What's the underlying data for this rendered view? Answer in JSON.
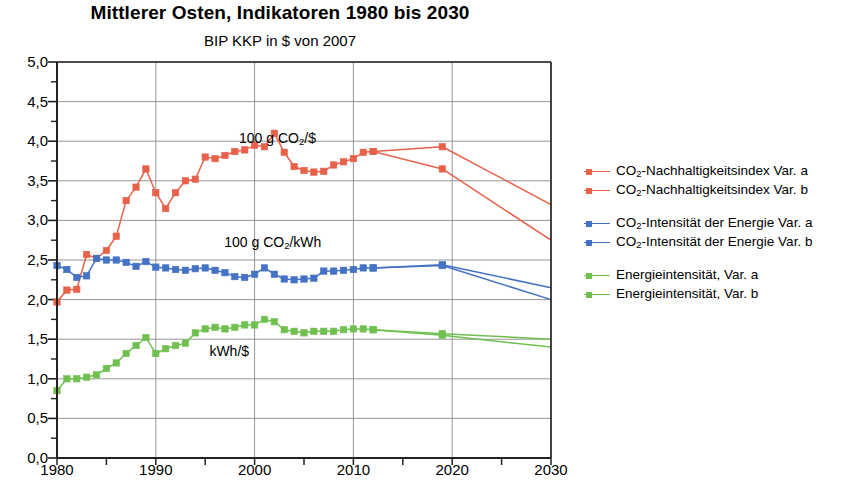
{
  "header": {
    "title": "Mittlerer Osten, Indikatoren 1980 bis 2030",
    "subtitle": "BIP KKP in $ von 2007"
  },
  "legend": {
    "groups": [
      {
        "color": "#e8614a",
        "items": [
          {
            "label_prefix": "CO",
            "label_sub": "2",
            "label_suffix": "-Nachhaltigkeitsindex Var. a",
            "name": "legend-item-co2-nachhaltigkeitsindex-var-a"
          },
          {
            "label_prefix": "CO",
            "label_sub": "2",
            "label_suffix": "-Nachhaltigkeitsindex Var. b",
            "name": "legend-item-co2-nachhaltigkeitsindex-var-b"
          }
        ]
      },
      {
        "color": "#4472c4",
        "items": [
          {
            "label_prefix": "CO",
            "label_sub": "2",
            "label_suffix": "-Intensität der Energie Var. a",
            "name": "legend-item-co2-intensitaet-var-a"
          },
          {
            "label_prefix": "CO",
            "label_sub": "2",
            "label_suffix": "-Intensität der Energie Var. b",
            "name": "legend-item-co2-intensitaet-var-b"
          }
        ]
      },
      {
        "color": "#70c050",
        "items": [
          {
            "label_prefix": "Energieintensität, Var. a",
            "label_sub": "",
            "label_suffix": "",
            "name": "legend-item-energieintensitaet-var-a"
          },
          {
            "label_prefix": "Energieintensität, Var. b",
            "label_sub": "",
            "label_suffix": "",
            "name": "legend-item-energieintensitaet-var-b"
          }
        ]
      }
    ]
  },
  "chart_data": {
    "type": "line",
    "title": "Mittlerer Osten, Indikatoren 1980 bis 2030",
    "subtitle": "BIP KKP in $ von 2007",
    "xlabel": "",
    "ylabel": "",
    "xlim": [
      1980,
      2030
    ],
    "ylim": [
      0.0,
      5.0
    ],
    "ytick_labels": [
      "0,0",
      "0,5",
      "1,0",
      "1,5",
      "2,0",
      "2,5",
      "3,0",
      "3,5",
      "4,0",
      "4,5",
      "5,0"
    ],
    "ytick_values": [
      0.0,
      0.5,
      1.0,
      1.5,
      2.0,
      2.5,
      3.0,
      3.5,
      4.0,
      4.5,
      5.0
    ],
    "yminor_step": 0.25,
    "xtick_labels": [
      "1980",
      "1990",
      "2000",
      "2010",
      "2020",
      "2030"
    ],
    "xtick_values": [
      1980,
      1990,
      2000,
      2010,
      2020,
      2030
    ],
    "xminor_step": 5,
    "grid": "horizontal-major and vertical-decade",
    "legend_position": "right",
    "annotations": [
      {
        "text_prefix": "100 g CO",
        "text_sub": "2",
        "text_suffix": "/$",
        "x": 2004.5,
        "y": 4.02,
        "name": "annotation-co2-per-dollar"
      },
      {
        "text_prefix": "100 g CO",
        "text_sub": "2",
        "text_suffix": "/kWh",
        "x": 2003.0,
        "y": 2.7,
        "name": "annotation-co2-per-kwh"
      },
      {
        "text_prefix": "kWh/$",
        "text_sub": "",
        "text_suffix": "",
        "x": 2001.5,
        "y": 1.32,
        "name": "annotation-kwh-per-dollar"
      }
    ],
    "series": [
      {
        "name": "CO2-Nachhaltigkeitsindex Var. a",
        "color": "#e8614a",
        "markers": true,
        "x": [
          1980,
          1981,
          1982,
          1983,
          1984,
          1985,
          1986,
          1987,
          1988,
          1989,
          1990,
          1991,
          1992,
          1993,
          1994,
          1995,
          1996,
          1997,
          1998,
          1999,
          2000,
          2001,
          2002,
          2003,
          2004,
          2005,
          2006,
          2007,
          2008,
          2009,
          2010,
          2011,
          2012,
          2019,
          2030
        ],
        "values": [
          1.97,
          2.12,
          2.13,
          2.57,
          2.52,
          2.62,
          2.8,
          3.25,
          3.42,
          3.65,
          3.35,
          3.15,
          3.35,
          3.5,
          3.52,
          3.8,
          3.78,
          3.82,
          3.87,
          3.89,
          3.95,
          3.93,
          4.1,
          3.86,
          3.68,
          3.63,
          3.61,
          3.62,
          3.7,
          3.74,
          3.78,
          3.86,
          3.87,
          3.65,
          2.75
        ]
      },
      {
        "name": "CO2-Nachhaltigkeitsindex Var. b",
        "color": "#e8614a",
        "markers": true,
        "x": [
          2012,
          2019,
          2030
        ],
        "values": [
          3.87,
          3.93,
          3.2
        ]
      },
      {
        "name": "CO2-Intensität der Energie Var. a",
        "color": "#4472c4",
        "markers": true,
        "x": [
          1980,
          1981,
          1982,
          1983,
          1984,
          1985,
          1986,
          1987,
          1988,
          1989,
          1990,
          1991,
          1992,
          1993,
          1994,
          1995,
          1996,
          1997,
          1998,
          1999,
          2000,
          2001,
          2002,
          2003,
          2004,
          2005,
          2006,
          2007,
          2008,
          2009,
          2010,
          2011,
          2012,
          2019,
          2030
        ],
        "values": [
          2.43,
          2.38,
          2.28,
          2.3,
          2.52,
          2.5,
          2.5,
          2.47,
          2.42,
          2.48,
          2.41,
          2.4,
          2.38,
          2.37,
          2.39,
          2.4,
          2.37,
          2.34,
          2.29,
          2.28,
          2.32,
          2.4,
          2.32,
          2.26,
          2.25,
          2.26,
          2.27,
          2.36,
          2.36,
          2.37,
          2.38,
          2.4,
          2.4,
          2.43,
          2.0
        ]
      },
      {
        "name": "CO2-Intensität der Energie Var. b",
        "color": "#4472c4",
        "markers": true,
        "x": [
          2012,
          2019,
          2030
        ],
        "values": [
          2.4,
          2.44,
          2.15
        ]
      },
      {
        "name": "Energieintensität, Var. a",
        "color": "#70c050",
        "markers": true,
        "x": [
          1980,
          1981,
          1982,
          1983,
          1984,
          1985,
          1986,
          1987,
          1988,
          1989,
          1990,
          1991,
          1992,
          1993,
          1994,
          1995,
          1996,
          1997,
          1998,
          1999,
          2000,
          2001,
          2002,
          2003,
          2004,
          2005,
          2006,
          2007,
          2008,
          2009,
          2010,
          2011,
          2012,
          2019,
          2030
        ],
        "values": [
          0.85,
          1.0,
          1.0,
          1.02,
          1.05,
          1.13,
          1.2,
          1.32,
          1.42,
          1.52,
          1.32,
          1.38,
          1.42,
          1.45,
          1.58,
          1.63,
          1.65,
          1.63,
          1.65,
          1.68,
          1.68,
          1.75,
          1.72,
          1.62,
          1.6,
          1.58,
          1.6,
          1.6,
          1.6,
          1.62,
          1.63,
          1.63,
          1.62,
          1.55,
          1.4
        ]
      },
      {
        "name": "Energieintensität, Var. b",
        "color": "#70c050",
        "markers": true,
        "x": [
          2012,
          2019,
          2030
        ],
        "values": [
          1.62,
          1.57,
          1.5
        ]
      }
    ]
  }
}
